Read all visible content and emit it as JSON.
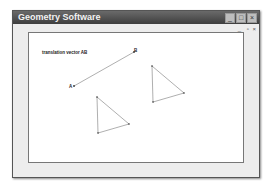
{
  "window": {
    "title": "Geometry Software",
    "controls": {
      "minimize": "_",
      "maximize": "□",
      "close": "×"
    },
    "mdi_controls": {
      "minimize": "_",
      "restore": "▫",
      "close": "×"
    }
  },
  "canvas": {
    "caption": "translation vector AB",
    "points": {
      "A": "A",
      "B": "B"
    },
    "vector": {
      "from": [
        74,
        86
      ],
      "to": [
        134,
        52
      ]
    },
    "triangles": [
      [
        [
          97,
          97
        ],
        [
          98,
          133
        ],
        [
          129,
          124
        ]
      ],
      [
        [
          152,
          66
        ],
        [
          153,
          102
        ],
        [
          184,
          93
        ]
      ]
    ],
    "colors": {
      "line": "#9a9a9a",
      "point": "#333333"
    }
  }
}
